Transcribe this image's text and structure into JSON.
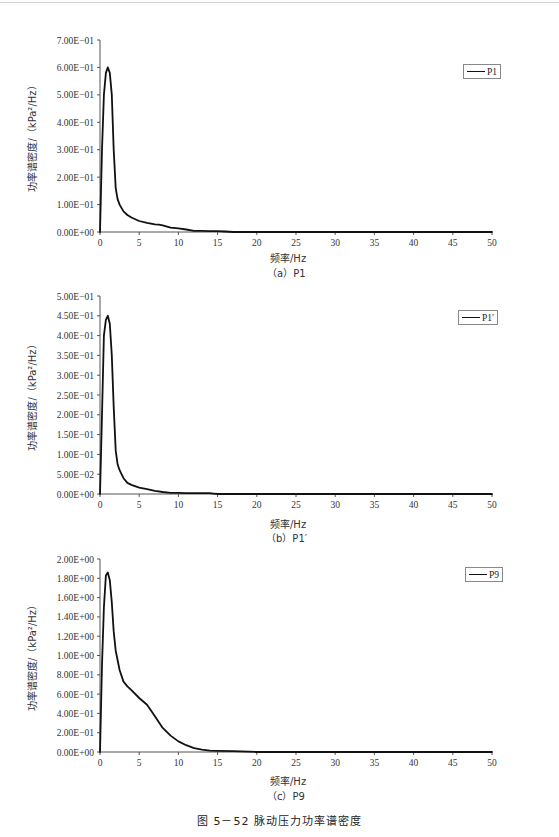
{
  "header": {
    "text": ""
  },
  "figure_caption": "图 5－52   脉动压力功率谱密度",
  "chart_data": [
    {
      "type": "line",
      "id": "a",
      "subcaption": "（a）P1",
      "title": "",
      "xlabel": "频率/Hz",
      "ylabel": "功率谱密度/（kPa²/Hz）",
      "legend": [
        "P1"
      ],
      "legend_position": "top-right",
      "grid": false,
      "xlim": [
        0,
        50
      ],
      "ylim": [
        0,
        0.7
      ],
      "xticks": [
        0,
        5,
        10,
        15,
        20,
        25,
        30,
        35,
        40,
        45,
        50
      ],
      "yticks": [
        0,
        0.1,
        0.2,
        0.3,
        0.4,
        0.5,
        0.6,
        0.7
      ],
      "ytick_labels": [
        "0.00E+00",
        "1.00E-01",
        "2.00E-01",
        "3.00E-01",
        "4.00E-01",
        "5.00E-01",
        "6.00E-01",
        "7.00E-01"
      ],
      "series": [
        {
          "name": "P1",
          "x": [
            0,
            0.25,
            0.5,
            0.75,
            1.0,
            1.25,
            1.5,
            1.75,
            2.0,
            2.25,
            2.5,
            3.0,
            3.5,
            4.0,
            5.0,
            6.0,
            7.0,
            7.5,
            8.0,
            9.0,
            10.0,
            11.0,
            12.0,
            13.0,
            14.0,
            15.0,
            16.0,
            17.0,
            20.0,
            25.0,
            30.0,
            35.0,
            40.0,
            45.0,
            50.0
          ],
          "y": [
            0.0,
            0.3,
            0.5,
            0.58,
            0.6,
            0.58,
            0.5,
            0.3,
            0.16,
            0.12,
            0.1,
            0.075,
            0.062,
            0.053,
            0.04,
            0.033,
            0.028,
            0.027,
            0.024,
            0.016,
            0.013,
            0.009,
            0.004,
            0.004,
            0.003,
            0.003,
            0.002,
            0.0,
            0.0,
            0.0,
            0.0,
            0.0,
            0.0,
            0.0,
            0.0
          ]
        }
      ]
    },
    {
      "type": "line",
      "id": "b",
      "subcaption": "（b）P1′",
      "title": "",
      "xlabel": "频率/Hz",
      "ylabel": "功率谱密度/（kPa²/Hz）",
      "legend": [
        "P1′"
      ],
      "legend_position": "top-right",
      "grid": false,
      "xlim": [
        0,
        50
      ],
      "ylim": [
        0,
        0.5
      ],
      "xticks": [
        0,
        5,
        10,
        15,
        20,
        25,
        30,
        35,
        40,
        45,
        50
      ],
      "yticks": [
        0,
        0.05,
        0.1,
        0.15,
        0.2,
        0.25,
        0.3,
        0.35,
        0.4,
        0.45,
        0.5
      ],
      "ytick_labels": [
        "0.00E+00",
        "5.00E-02",
        "1.00E-01",
        "1.50E-01",
        "2.00E-01",
        "2.50E-01",
        "3.00E-01",
        "3.50E-01",
        "4.00E-01",
        "4.50E-01",
        "5.00E-01"
      ],
      "series": [
        {
          "name": "P1′",
          "x": [
            0,
            0.25,
            0.5,
            0.75,
            1.0,
            1.25,
            1.5,
            1.75,
            2.0,
            2.25,
            2.5,
            3.0,
            3.5,
            4.0,
            5.0,
            6.0,
            7.0,
            8.0,
            9.0,
            10.0,
            11.0,
            12.0,
            13.0,
            14.0,
            14.5,
            15.0,
            20.0,
            25.0,
            30.0,
            35.0,
            40.0,
            45.0,
            50.0
          ],
          "y": [
            0.0,
            0.2,
            0.4,
            0.44,
            0.45,
            0.43,
            0.35,
            0.22,
            0.11,
            0.075,
            0.06,
            0.04,
            0.028,
            0.023,
            0.016,
            0.012,
            0.008,
            0.005,
            0.003,
            0.003,
            0.002,
            0.002,
            0.002,
            0.002,
            0.001,
            0.0,
            0.0,
            0.0,
            0.0,
            0.0,
            0.0,
            0.0,
            0.0
          ]
        }
      ]
    },
    {
      "type": "line",
      "id": "c",
      "subcaption": "（c）P9",
      "title": "",
      "xlabel": "频率/Hz",
      "ylabel": "功率谱密度/（kPa²/Hz）",
      "legend": [
        "P9"
      ],
      "legend_position": "top-right",
      "grid": false,
      "xlim": [
        0,
        50
      ],
      "ylim": [
        0,
        2.0
      ],
      "xticks": [
        0,
        5,
        10,
        15,
        20,
        25,
        30,
        35,
        40,
        45,
        50
      ],
      "yticks": [
        0,
        0.2,
        0.4,
        0.6,
        0.8,
        1.0,
        1.2,
        1.4,
        1.6,
        1.8,
        2.0
      ],
      "ytick_labels": [
        "0.00E+00",
        "2.00E-01",
        "4.00E-01",
        "6.00E-01",
        "8.00E-01",
        "1.00E+00",
        "1.20E+00",
        "1.40E+00",
        "1.60E+00",
        "1.80E+00",
        "2.00E+00"
      ],
      "series": [
        {
          "name": "P9",
          "x": [
            0,
            0.25,
            0.5,
            0.75,
            1.0,
            1.25,
            1.5,
            1.75,
            2.0,
            2.5,
            3.0,
            3.5,
            4.0,
            5.0,
            6.0,
            6.5,
            7.0,
            8.0,
            9.0,
            10.0,
            11.0,
            12.0,
            13.0,
            14.0,
            15.0,
            17.0,
            19.0,
            20.0,
            25.0,
            30.0,
            35.0,
            40.0,
            45.0,
            50.0
          ],
          "y": [
            0.0,
            0.9,
            1.5,
            1.83,
            1.86,
            1.78,
            1.55,
            1.25,
            1.05,
            0.85,
            0.73,
            0.68,
            0.64,
            0.56,
            0.49,
            0.43,
            0.37,
            0.25,
            0.17,
            0.11,
            0.07,
            0.04,
            0.025,
            0.015,
            0.012,
            0.008,
            0.004,
            0.0,
            0.0,
            0.0,
            0.0,
            0.0,
            0.0,
            0.0
          ]
        }
      ]
    }
  ]
}
